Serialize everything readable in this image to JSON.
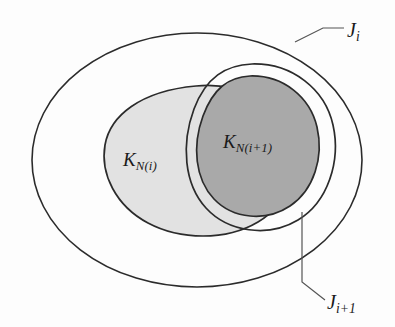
{
  "figure": {
    "background_color": "#fdfdfd",
    "stroke_color": "#2b2b2b",
    "labels": {
      "outer_region": "J",
      "outer_region_sub": "i",
      "inner_region": "J",
      "inner_region_sub": "i+1",
      "light_set": "K",
      "light_set_sub": "N(i)",
      "dark_set": "K",
      "dark_set_sub": "N(i+1)"
    },
    "regions": [
      {
        "name": "J_i",
        "kind": "outer-ellipse",
        "fill": "none",
        "stroke": "#2b2b2b",
        "label": "J_i"
      },
      {
        "name": "K_N(i)",
        "kind": "light-blob",
        "fill": "#e2e2e2",
        "stroke": "#2b2b2b",
        "label": "K_N(i)"
      },
      {
        "name": "J_i+1",
        "kind": "inner-outline-blob",
        "fill": "none",
        "stroke": "#2b2b2b",
        "label": "J_i+1"
      },
      {
        "name": "K_N(i+1)",
        "kind": "dark-blob",
        "fill": "#a9a9a9",
        "stroke": "#2b2b2b",
        "label": "K_N(i+1)"
      }
    ],
    "colors": {
      "light_gray": "#e2e2e2",
      "dark_gray": "#a9a9a9",
      "outline": "#2b2b2b",
      "leader_line": "#555555",
      "paper": "#fdfdfd"
    },
    "leader_lines": [
      {
        "name": "leader-Ji",
        "from_region": "J_i",
        "to_label": "J_i"
      },
      {
        "name": "leader-Ji1",
        "from_region": "J_i+1",
        "to_label": "J_i+1"
      }
    ]
  }
}
